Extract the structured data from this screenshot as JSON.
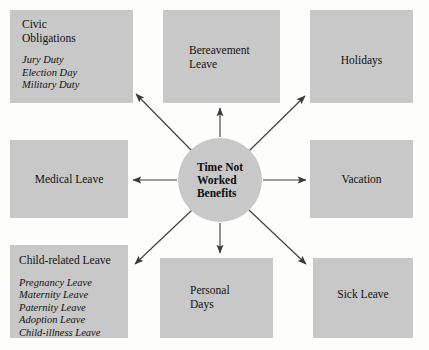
{
  "diagram": {
    "type": "radial-hub-and-spoke",
    "title": "Time Not Worked Benefits",
    "background_color": "#fdfdfc",
    "node_fill_color": "#c8c8c8",
    "arrow_color": "#3a3a3a",
    "text_color": "#111111",
    "hub": {
      "label": "Time Not\nWorked\nBenefits",
      "label_lines": [
        "Time Not",
        "Worked",
        "Benefits"
      ],
      "shape": "circle",
      "cx": 220,
      "cy": 180,
      "r": 42
    },
    "nodes": [
      {
        "id": "civic-obligations",
        "title": "Civic\nObligations",
        "title_lines": [
          "Civic",
          "Obligations"
        ],
        "items": [
          "Jury Duty",
          "Election Day",
          "Military Duty"
        ],
        "align": "left",
        "x": 10,
        "y": 10,
        "w": 123,
        "h": 93,
        "text_x": 12,
        "text_y": 8
      },
      {
        "id": "bereavement-leave",
        "title": "Bereavement\nLeave",
        "title_lines": [
          "Bereavement",
          "Leave"
        ],
        "items": [],
        "align": "left",
        "x": 163,
        "y": 10,
        "w": 117,
        "h": 93,
        "text_x": 26,
        "text_y": 34
      },
      {
        "id": "holidays",
        "title": "Holidays",
        "title_lines": [
          "Holidays"
        ],
        "items": [],
        "align": "center",
        "x": 310,
        "y": 10,
        "w": 103,
        "h": 93,
        "text_x": 0,
        "text_y": 44
      },
      {
        "id": "medical-leave",
        "title": "Medical Leave",
        "title_lines": [
          "Medical Leave"
        ],
        "items": [],
        "align": "center",
        "x": 10,
        "y": 140,
        "w": 118,
        "h": 78,
        "text_x": 0,
        "text_y": 33
      },
      {
        "id": "vacation",
        "title": "Vacation",
        "title_lines": [
          "Vacation"
        ],
        "items": [],
        "align": "center",
        "x": 310,
        "y": 140,
        "w": 103,
        "h": 78,
        "text_x": 0,
        "text_y": 33
      },
      {
        "id": "child-related-leave",
        "title": "Child-related Leave",
        "title_lines": [
          "Child-related Leave"
        ],
        "items": [
          "Pregnancy Leave",
          "Maternity Leave",
          "Paternity Leave",
          "Adoption Leave",
          "Child-illness Leave"
        ],
        "align": "left",
        "x": 10,
        "y": 245,
        "w": 118,
        "h": 93,
        "text_x": 9,
        "text_y": 9
      },
      {
        "id": "personal-days",
        "title": "Personal\nDays",
        "title_lines": [
          "Personal",
          "Days"
        ],
        "items": [],
        "align": "left",
        "x": 160,
        "y": 258,
        "w": 113,
        "h": 80,
        "text_x": 30,
        "text_y": 26
      },
      {
        "id": "sick-leave",
        "title": "Sick Leave",
        "title_lines": [
          "Sick Leave"
        ],
        "items": [],
        "align": "center",
        "x": 313,
        "y": 258,
        "w": 100,
        "h": 80,
        "text_x": 0,
        "text_y": 30
      }
    ],
    "connectors": [
      {
        "id": "arrow-to-civic-obligations",
        "x1": 192,
        "y1": 151,
        "x2": 136,
        "y2": 94,
        "target": "civic-obligations"
      },
      {
        "id": "arrow-to-bereavement-leave",
        "x1": 220,
        "y1": 137,
        "x2": 220,
        "y2": 108,
        "target": "bereavement-leave"
      },
      {
        "id": "arrow-to-holidays",
        "x1": 249,
        "y1": 151,
        "x2": 305,
        "y2": 96,
        "target": "holidays"
      },
      {
        "id": "arrow-to-medical-leave",
        "x1": 177,
        "y1": 180,
        "x2": 133,
        "y2": 180,
        "target": "medical-leave"
      },
      {
        "id": "arrow-to-vacation",
        "x1": 263,
        "y1": 180,
        "x2": 306,
        "y2": 180,
        "target": "vacation"
      },
      {
        "id": "arrow-to-child-related-leave",
        "x1": 192,
        "y1": 210,
        "x2": 135,
        "y2": 264,
        "target": "child-related-leave"
      },
      {
        "id": "arrow-to-personal-days",
        "x1": 220,
        "y1": 223,
        "x2": 220,
        "y2": 253,
        "target": "personal-days"
      },
      {
        "id": "arrow-to-sick-leave",
        "x1": 249,
        "y1": 210,
        "x2": 306,
        "y2": 264,
        "target": "sick-leave"
      }
    ]
  }
}
